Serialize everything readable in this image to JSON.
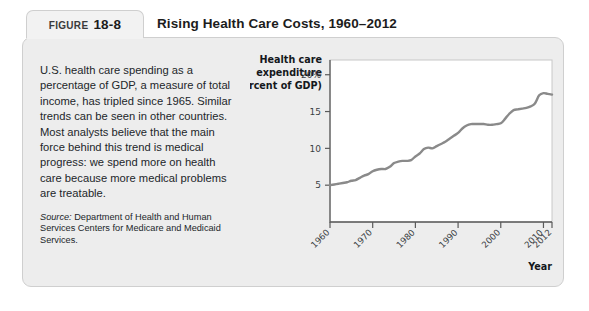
{
  "figure": {
    "tab_word": "FIGURE",
    "tab_number": "18-8",
    "title": "Rising Health Care Costs, 1960–2012",
    "caption": "U.S. health care spending as a percentage of GDP, a measure of total income, has tripled since 1965. Similar trends can be seen in other countries. Most analysts believe that the main force behind this trend is medical progress: we spend more on health care because more medical problems are treatable.",
    "source_label": "Source:",
    "source_text": " Department of Health and Human Services Centers for Medicare and Medicaid Services."
  },
  "colors": {
    "panel_background": "#ededed",
    "panel_border": "#cfcfcf",
    "tab_background": "#f2f2f2",
    "plot_background": "#ffffff",
    "plot_border": "#c8c8c8",
    "line": "#8a8a8a",
    "axis": "#5a5a5a",
    "text": "#22262a"
  },
  "chart_data": {
    "type": "line",
    "title": "Rising Health Care Costs, 1960–2012",
    "ylabel": "Health care expenditure (percent of GDP)",
    "ylabel_lines": [
      "Health care",
      "expenditure",
      "(percent of GDP)"
    ],
    "xlabel": "Year",
    "xlim": [
      1960,
      2012
    ],
    "ylim": [
      0,
      22
    ],
    "grid": false,
    "legend": "none",
    "ytick_labels": [
      "20%",
      "15",
      "10",
      "5"
    ],
    "ytick_values": [
      20,
      15,
      10,
      5
    ],
    "xtick_labels": [
      "1960",
      "1970",
      "1980",
      "1990",
      "2000",
      "2010",
      "2012"
    ],
    "xtick_values": [
      1960,
      1970,
      1980,
      1990,
      2000,
      2010,
      2012
    ],
    "series": [
      {
        "name": "Health care expenditure (percent of GDP)",
        "x": [
          1960,
          1961,
          1962,
          1963,
          1964,
          1965,
          1966,
          1967,
          1968,
          1969,
          1970,
          1971,
          1972,
          1973,
          1974,
          1975,
          1976,
          1977,
          1978,
          1979,
          1980,
          1981,
          1982,
          1983,
          1984,
          1985,
          1986,
          1987,
          1988,
          1989,
          1990,
          1991,
          1992,
          1993,
          1994,
          1995,
          1996,
          1997,
          1998,
          1999,
          2000,
          2001,
          2002,
          2003,
          2004,
          2005,
          2006,
          2007,
          2008,
          2009,
          2010,
          2011,
          2012
        ],
        "values": [
          5.0,
          5.1,
          5.2,
          5.3,
          5.4,
          5.6,
          5.7,
          6.0,
          6.3,
          6.5,
          6.9,
          7.1,
          7.2,
          7.2,
          7.5,
          8.0,
          8.2,
          8.3,
          8.3,
          8.4,
          8.9,
          9.3,
          9.9,
          10.1,
          10.0,
          10.3,
          10.6,
          10.9,
          11.3,
          11.7,
          12.1,
          12.7,
          13.1,
          13.3,
          13.3,
          13.3,
          13.3,
          13.2,
          13.2,
          13.3,
          13.4,
          14.0,
          14.7,
          15.2,
          15.3,
          15.4,
          15.5,
          15.7,
          16.1,
          17.2,
          17.5,
          17.4,
          17.3
        ]
      }
    ]
  }
}
